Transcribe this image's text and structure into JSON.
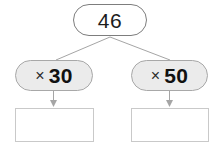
{
  "diagram": {
    "type": "multiplication-branching-diagram",
    "start": {
      "value": "46"
    },
    "branches": [
      {
        "id": "left",
        "operation_sign": "×",
        "operation_value": "30",
        "operation_label": "× 30",
        "answer": ""
      },
      {
        "id": "right",
        "operation_sign": "×",
        "operation_value": "50",
        "operation_label": "× 50",
        "answer": ""
      }
    ]
  },
  "colors": {
    "background": "#ffffff",
    "start_node_fill": "#ffffff",
    "start_node_border": "#7d7d7d",
    "operation_node_fill": "#ebebeb",
    "operation_node_border": "#a8a8a8",
    "answer_box_fill": "#ffffff",
    "answer_box_border": "#c9c9c9",
    "connector_line": "#a5a5a5",
    "text": "#111111"
  }
}
